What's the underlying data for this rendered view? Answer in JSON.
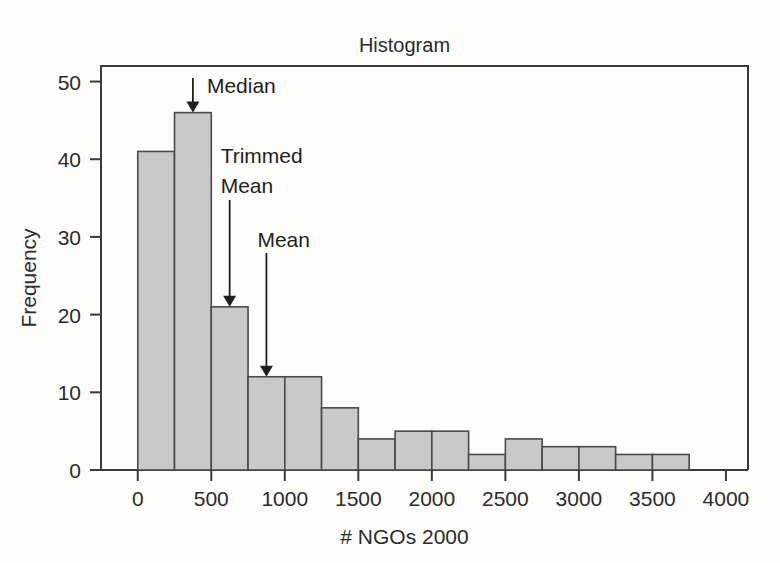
{
  "chart_data": {
    "type": "bar",
    "title": "Histogram",
    "xlabel": "# NGOs 2000",
    "ylabel": "Frequency",
    "xlim": [
      -250,
      4150
    ],
    "ylim": [
      0,
      52
    ],
    "grid": false,
    "legend": null,
    "bin_width": 250,
    "bin_edges": [
      0,
      250,
      500,
      750,
      1000,
      1250,
      1500,
      1750,
      2000,
      2250,
      2500,
      2750,
      3000,
      3250,
      3500,
      3750
    ],
    "categories": [
      "0-250",
      "250-500",
      "500-750",
      "750-1000",
      "1000-1250",
      "1250-1500",
      "1500-1750",
      "1750-2000",
      "2000-2250",
      "2250-2500",
      "2500-2750",
      "2750-3000",
      "3000-3250",
      "3250-3500",
      "3500-3750"
    ],
    "values": [
      41,
      46,
      21,
      12,
      12,
      8,
      4,
      5,
      5,
      2,
      4,
      3,
      3,
      2,
      2
    ],
    "xticks": [
      0,
      500,
      1000,
      1500,
      2000,
      2500,
      3000,
      3500,
      4000
    ],
    "xtick_labels": [
      "0",
      "500",
      "1000",
      "1500",
      "2000",
      "2500",
      "3000",
      "3500",
      "4000"
    ],
    "yticks": [
      0,
      10,
      20,
      30,
      40,
      50
    ],
    "ytick_labels": [
      "0",
      "10",
      "20",
      "30",
      "40",
      "50"
    ],
    "bar_fill_color": "#c9c9c9",
    "bar_edge_color": "#4a4a4a",
    "annotations": [
      {
        "label": "Median",
        "x_value": 375,
        "y_value": 46
      },
      {
        "label": "Trimmed Mean",
        "label_line1": "Trimmed",
        "label_line2": "Mean",
        "x_value": 625,
        "y_value": 21
      },
      {
        "label": "Mean",
        "x_value": 875,
        "y_value": 12
      }
    ]
  },
  "figure": {
    "title": "Histogram",
    "x_axis_title": "# NGOs 2000",
    "y_axis_title": "Frequency"
  }
}
